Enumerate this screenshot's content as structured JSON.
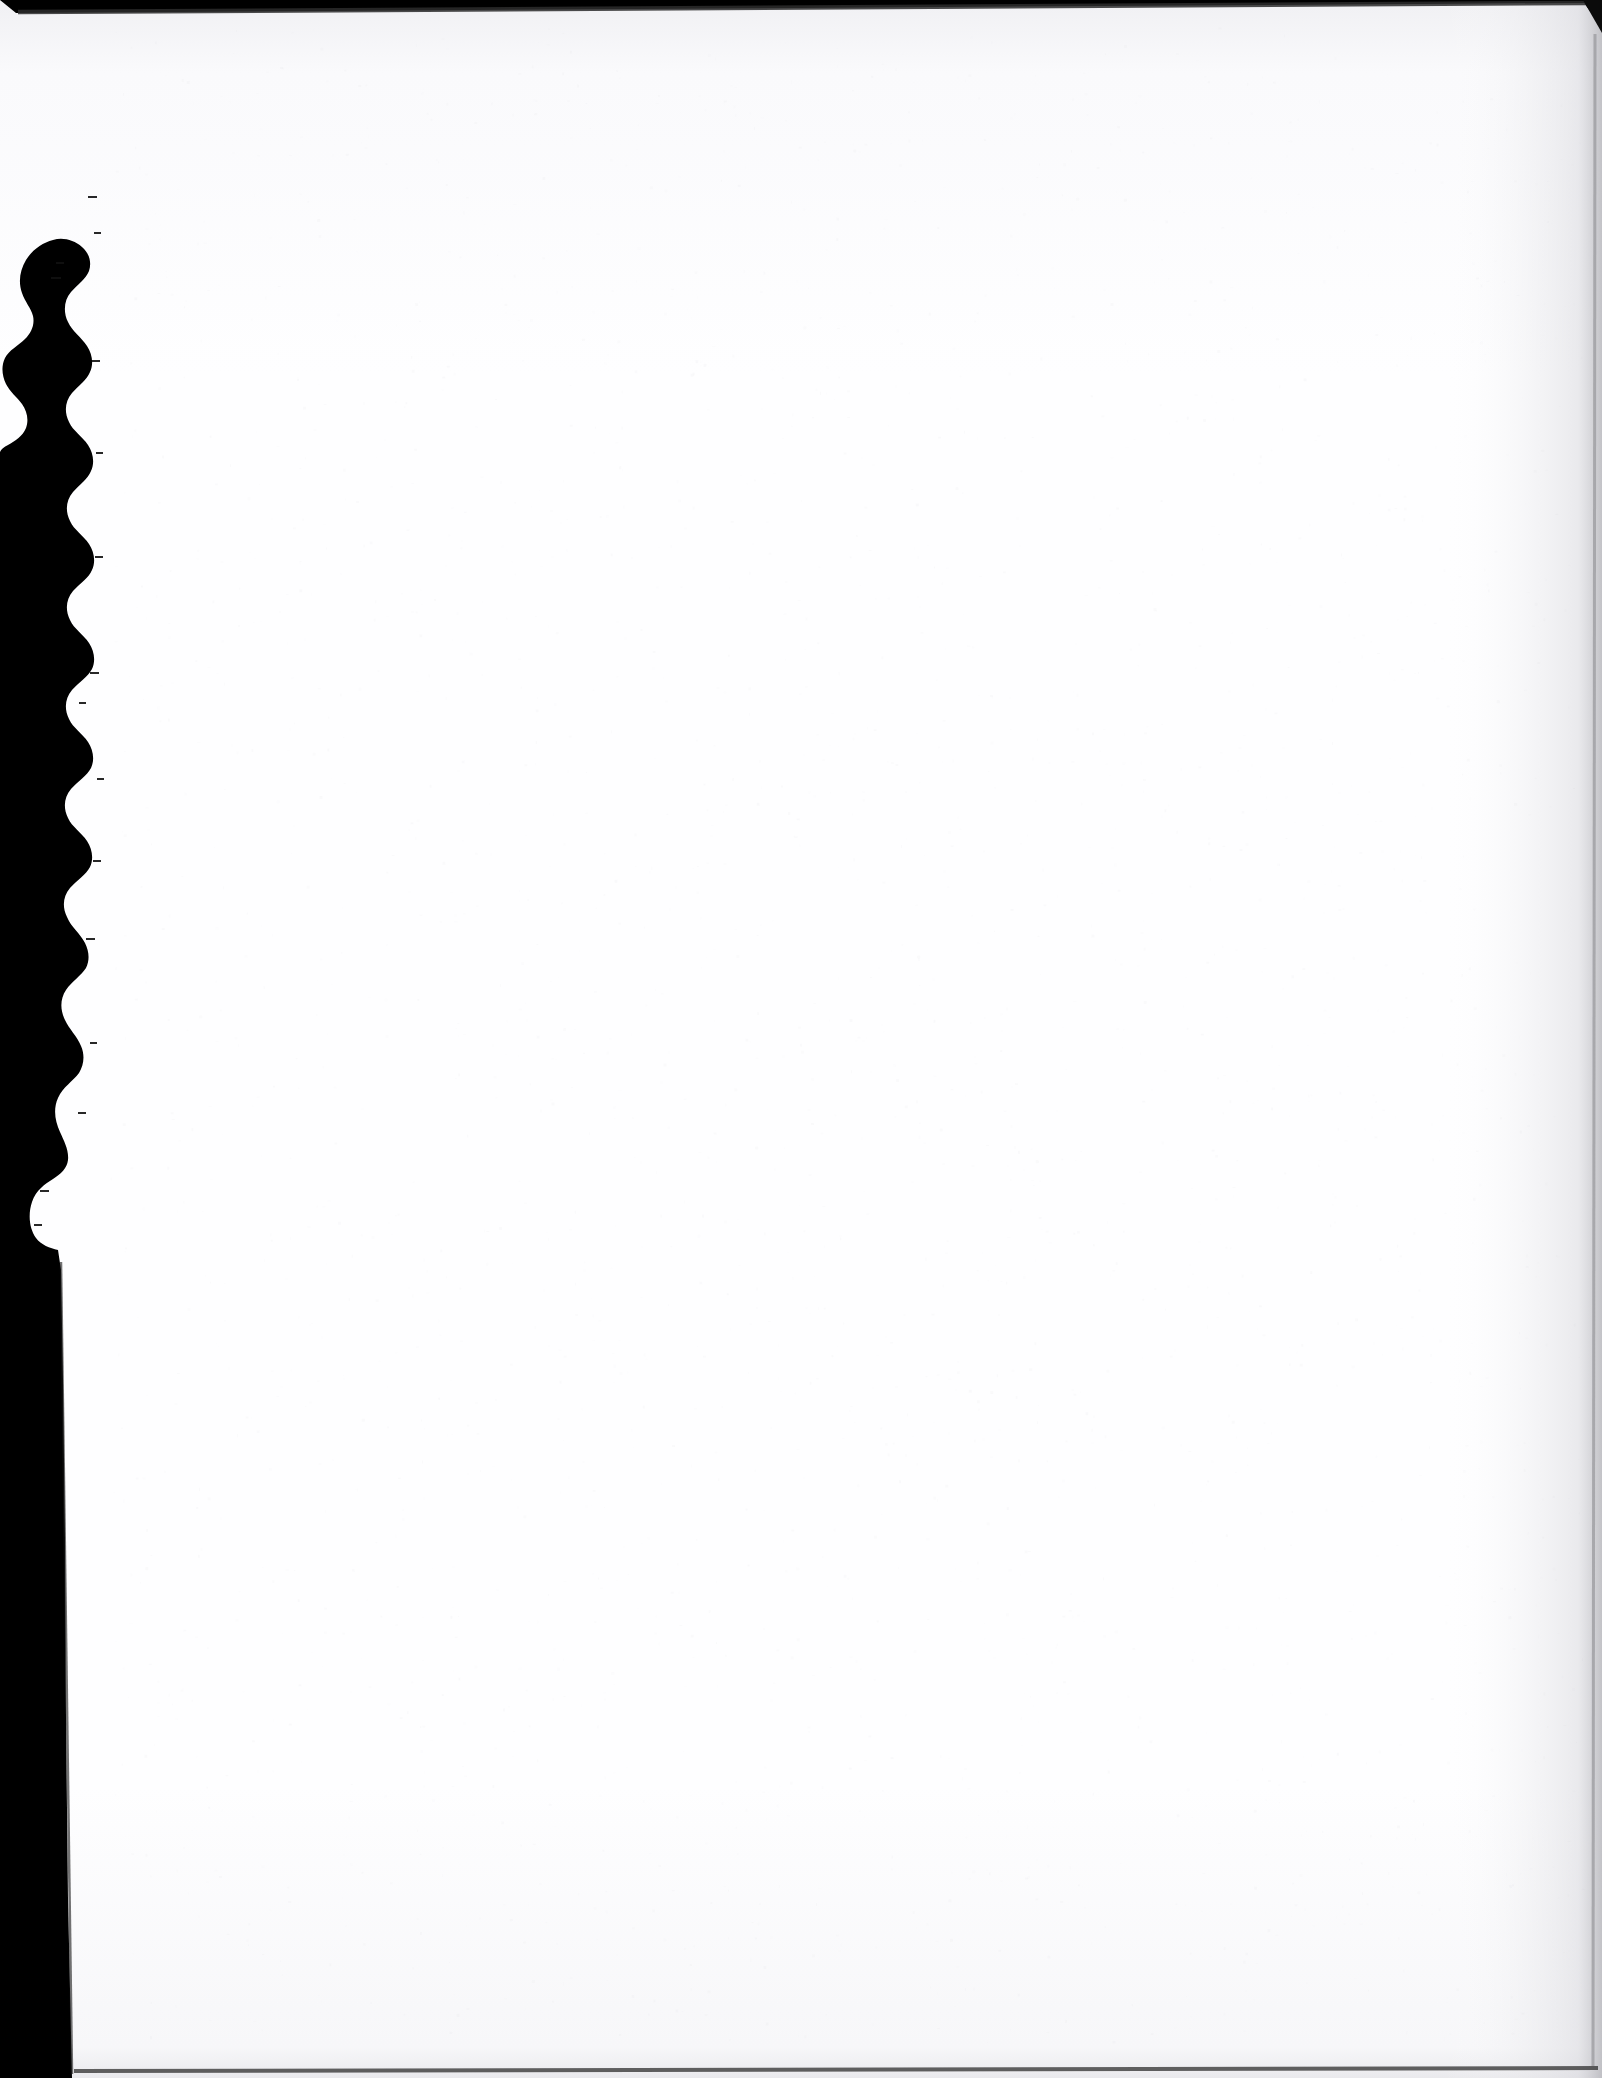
{
  "document": {
    "kind": "scanned-page-image",
    "page_label": "",
    "page_text": "",
    "is_blank": true,
    "orientation": "portrait"
  },
  "canvas": {
    "width": 1602,
    "height": 2078
  },
  "colors": {
    "scanner_background": "#000000",
    "paper_white": "#fefeff",
    "paper_shade_top": "#f4f4f6",
    "paper_shade_right": "#f2f2f4",
    "paper_edge_line": "#2b2b2b",
    "paper_edge_line_soft": "#9a9a9e"
  },
  "regions": {
    "torn_edge": {
      "label": "ragged torn left edge",
      "side": "left",
      "from_y": 0,
      "to_y": 1250,
      "min_x": 8,
      "max_x": 95
    },
    "straight_edge": {
      "label": "clean cut lower left edge",
      "side": "left",
      "from_y": 1250,
      "to_y": 2078,
      "x_top": 66,
      "x_bottom": 72
    },
    "top_edge": {
      "label": "top page edge with thin dark scan line",
      "y": 10
    },
    "right_edge": {
      "label": "right page edge with faint gray scan line",
      "x": 1595
    },
    "bottom_edge": {
      "label": "bottom page edge with thin dark scan line",
      "y": 2070
    },
    "corner_notch_top_right": {
      "label": "small dark triangular corner notch",
      "x": 1583,
      "y": 0,
      "width": 19,
      "height": 32
    }
  },
  "chart_data": null
}
